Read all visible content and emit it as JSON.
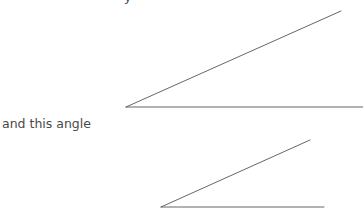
{
  "caption": {
    "text": "and this angle",
    "color": "#4a4a4a"
  },
  "cutoff_text": {
    "text": "y"
  },
  "diagram": {
    "stroke_color": "#555555",
    "angles": [
      {
        "name": "first-angle",
        "vertex": [
          126,
          107
        ],
        "upper_ray_end": [
          341,
          11
        ],
        "base_ray_end": [
          363,
          107
        ]
      },
      {
        "name": "second-angle",
        "vertex": [
          161,
          207
        ],
        "upper_ray_end": [
          310,
          140
        ],
        "base_ray_end": [
          324,
          207
        ]
      }
    ]
  }
}
